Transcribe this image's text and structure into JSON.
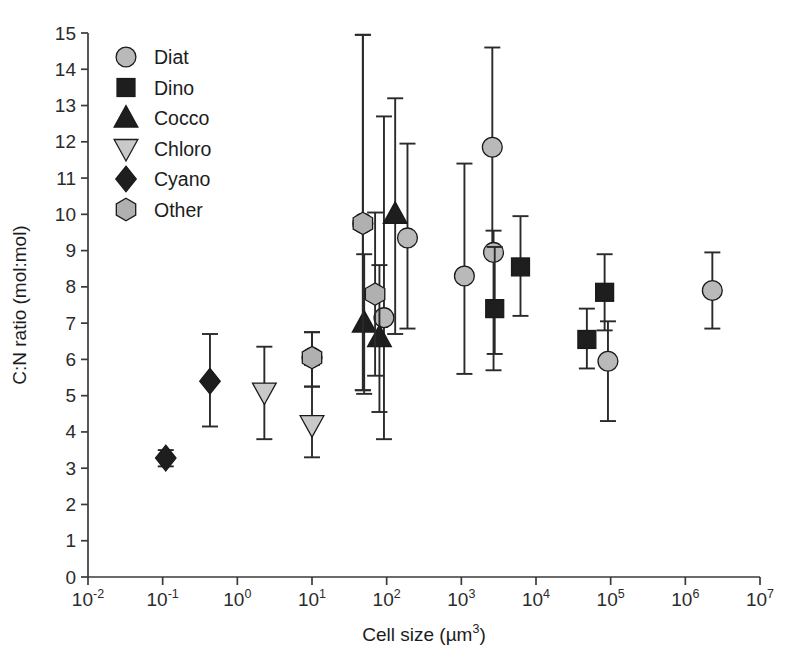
{
  "chart_data": {
    "type": "scatter",
    "title": "",
    "xlabel": "Cell size (µm³)",
    "ylabel": "C:N ratio (mol:mol)",
    "xscale": "log",
    "xlim": [
      0.01,
      10000000
    ],
    "ylim": [
      0,
      15
    ],
    "yticks": [
      0,
      1,
      2,
      3,
      4,
      5,
      6,
      7,
      8,
      9,
      10,
      11,
      12,
      13,
      14,
      15
    ],
    "xticks": [
      0.01,
      0.1,
      1,
      10,
      100,
      1000,
      10000,
      100000,
      1000000,
      10000000
    ],
    "xtick_labels": [
      "10-2",
      "10-1",
      "100",
      "101",
      "102",
      "103",
      "104",
      "105",
      "106",
      "107"
    ],
    "grid": false,
    "legend_position": "top-left",
    "error_bars": "vertical, capped (standard deviation)",
    "series": [
      {
        "name": "Diat",
        "marker": "circle",
        "fill": "#b9b9b9",
        "points": [
          {
            "x": 10.0,
            "y": 6.05,
            "ylo": 5.25,
            "yhi": 6.75
          },
          {
            "x": 48.0,
            "y": 9.75,
            "ylo": 5.15,
            "yhi": 14.95
          },
          {
            "x": 92.0,
            "y": 7.15,
            "ylo": 3.8,
            "yhi": 12.7
          },
          {
            "x": 190.0,
            "y": 9.35,
            "ylo": 6.85,
            "yhi": 11.95
          },
          {
            "x": 1100.0,
            "y": 8.3,
            "ylo": 5.6,
            "yhi": 11.4
          },
          {
            "x": 2600.0,
            "y": 11.85,
            "ylo": 8.95,
            "yhi": 14.6
          },
          {
            "x": 2700.0,
            "y": 8.95,
            "ylo": 5.7,
            "yhi": 9.55
          },
          {
            "x": 92000.0,
            "y": 5.95,
            "ylo": 4.3,
            "yhi": 7.05
          },
          {
            "x": 2300000.0,
            "y": 7.9,
            "ylo": 6.85,
            "yhi": 8.95
          }
        ]
      },
      {
        "name": "Dino",
        "marker": "square",
        "fill": "#1e1e1e",
        "points": [
          {
            "x": 2800.0,
            "y": 7.4,
            "ylo": 6.15,
            "yhi": 9.1
          },
          {
            "x": 6200.0,
            "y": 8.55,
            "ylo": 7.2,
            "yhi": 9.95
          },
          {
            "x": 48000.0,
            "y": 6.55,
            "ylo": 5.75,
            "yhi": 7.4
          },
          {
            "x": 83000.0,
            "y": 7.85,
            "ylo": 6.8,
            "yhi": 8.9
          }
        ]
      },
      {
        "name": "Cocco",
        "marker": "triangle-up",
        "fill": "#1e1e1e",
        "points": [
          {
            "x": 50.0,
            "y": 7.0,
            "ylo": 5.05,
            "yhi": 8.9
          },
          {
            "x": 80.0,
            "y": 6.6,
            "ylo": 4.55,
            "yhi": 8.6
          },
          {
            "x": 130.0,
            "y": 10.0,
            "ylo": 6.7,
            "yhi": 13.2
          }
        ]
      },
      {
        "name": "Chloro",
        "marker": "triangle-down",
        "fill": "#c9c9c9",
        "points": [
          {
            "x": 2.3,
            "y": 5.1,
            "ylo": 3.8,
            "yhi": 6.35
          },
          {
            "x": 10.0,
            "y": 4.2,
            "ylo": 3.3,
            "yhi": 5.85
          }
        ]
      },
      {
        "name": "Cyano",
        "marker": "diamond",
        "fill": "#1e1e1e",
        "points": [
          {
            "x": 0.11,
            "y": 3.28,
            "ylo": 3.05,
            "yhi": 3.5
          },
          {
            "x": 0.43,
            "y": 5.4,
            "ylo": 4.15,
            "yhi": 6.7
          }
        ]
      },
      {
        "name": "Other",
        "marker": "hexagon",
        "fill": "#b0b0b0",
        "points": [
          {
            "x": 10.0,
            "y": 6.05,
            "ylo": 5.25,
            "yhi": 6.75
          },
          {
            "x": 48.0,
            "y": 9.75,
            "ylo": 5.15,
            "yhi": 14.95
          },
          {
            "x": 70.0,
            "y": 7.8,
            "ylo": 5.55,
            "yhi": 10.05
          }
        ]
      }
    ]
  },
  "legend": {
    "items": [
      {
        "label": "Diat",
        "marker": "circle"
      },
      {
        "label": "Dino",
        "marker": "square"
      },
      {
        "label": "Cocco",
        "marker": "triangle-up"
      },
      {
        "label": "Chloro",
        "marker": "triangle-down"
      },
      {
        "label": "Cyano",
        "marker": "diamond"
      },
      {
        "label": "Other",
        "marker": "hexagon"
      }
    ]
  },
  "axes": {
    "y_title": "C:N ratio (mol:mol)",
    "x_title_main": "Cell size (µm",
    "x_title_sup": "3",
    "x_title_close": ")",
    "y_tick_labels": [
      "15",
      "14",
      "13",
      "12",
      "11",
      "10",
      "9",
      "8",
      "7",
      "6",
      "5",
      "4",
      "3",
      "2",
      "1",
      "0"
    ],
    "x_tick_base": "10",
    "x_tick_exponents": [
      "-2",
      "-1",
      "0",
      "1",
      "2",
      "3",
      "4",
      "5",
      "6",
      "7"
    ]
  },
  "colors": {
    "axis": "#3a3a3a",
    "marker_dark": "#1e1e1e",
    "marker_light": "#b9b9b9",
    "background": "#ffffff"
  }
}
